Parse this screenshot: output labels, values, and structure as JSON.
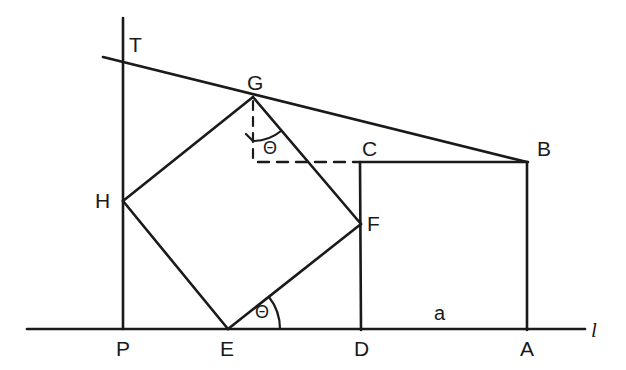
{
  "figure": {
    "type": "geometry-diagram",
    "background_color": "#ffffff",
    "stroke_color": "#1a1a1a",
    "canvas": {
      "width": 626,
      "height": 370
    }
  },
  "labels": {
    "T": "T",
    "G": "G",
    "H": "H",
    "C": "C",
    "B": "B",
    "F": "F",
    "P": "P",
    "E": "E",
    "D": "D",
    "A": "A",
    "line_l": "l",
    "side_a": "a",
    "theta_at_G": "Θ",
    "theta_at_E": "Θ"
  },
  "points": {
    "T": {
      "x": 123,
      "y": 57
    },
    "G": {
      "x": 253,
      "y": 97
    },
    "H": {
      "x": 123,
      "y": 201
    },
    "C": {
      "x": 360,
      "y": 162
    },
    "B": {
      "x": 527,
      "y": 162
    },
    "F": {
      "x": 361,
      "y": 224
    },
    "P": {
      "x": 123,
      "y": 329
    },
    "E": {
      "x": 228,
      "y": 329
    },
    "D": {
      "x": 361,
      "y": 329
    },
    "A": {
      "x": 527,
      "y": 329
    }
  },
  "label_positions": {
    "T": {
      "x": 129,
      "y": 34
    },
    "G": {
      "x": 247,
      "y": 72
    },
    "H": {
      "x": 95,
      "y": 190
    },
    "C": {
      "x": 362,
      "y": 138
    },
    "B": {
      "x": 537,
      "y": 138
    },
    "F": {
      "x": 367,
      "y": 213
    },
    "P": {
      "x": 116,
      "y": 338
    },
    "E": {
      "x": 220,
      "y": 338
    },
    "D": {
      "x": 354,
      "y": 338
    },
    "A": {
      "x": 520,
      "y": 338
    },
    "line_l": {
      "x": 591,
      "y": 320
    },
    "side_a": {
      "x": 434,
      "y": 303
    },
    "theta_at_G": {
      "x": 263,
      "y": 139
    },
    "theta_at_E": {
      "x": 255,
      "y": 303
    }
  },
  "segments": {
    "baseline_l": {
      "from": {
        "x": 27,
        "y": 329
      },
      "to": {
        "x": 585,
        "y": 329
      },
      "style": "solid"
    },
    "vertical_PT": {
      "from": {
        "x": 123,
        "y": 18
      },
      "to": {
        "x": 123,
        "y": 329
      },
      "style": "solid"
    },
    "tangent_TGB": {
      "from": {
        "x": 103,
        "y": 57
      },
      "to": {
        "x": 527,
        "y": 162
      },
      "style": "solid"
    },
    "square_GH": {
      "from": {
        "x": 253,
        "y": 97
      },
      "to": {
        "x": 123,
        "y": 201
      },
      "style": "solid"
    },
    "square_HE": {
      "from": {
        "x": 123,
        "y": 201
      },
      "to": {
        "x": 228,
        "y": 329
      },
      "style": "solid"
    },
    "square_EF": {
      "from": {
        "x": 228,
        "y": 329
      },
      "to": {
        "x": 361,
        "y": 224
      },
      "style": "solid"
    },
    "square_FG": {
      "from": {
        "x": 361,
        "y": 224
      },
      "to": {
        "x": 253,
        "y": 97
      },
      "style": "solid"
    },
    "rect_CB": {
      "from": {
        "x": 360,
        "y": 162
      },
      "to": {
        "x": 527,
        "y": 162
      },
      "style": "solid"
    },
    "rect_BA": {
      "from": {
        "x": 527,
        "y": 162
      },
      "to": {
        "x": 527,
        "y": 329
      },
      "style": "solid"
    },
    "rect_CD": {
      "from": {
        "x": 360,
        "y": 162
      },
      "to": {
        "x": 361,
        "y": 329
      },
      "style": "solid"
    },
    "dashed_G_vertical": {
      "from": {
        "x": 253,
        "y": 100
      },
      "to": {
        "x": 253,
        "y": 163
      },
      "style": "dashed"
    },
    "dashed_horizontal_to_C": {
      "from": {
        "x": 258,
        "y": 162
      },
      "to": {
        "x": 358,
        "y": 162
      },
      "style": "dashed"
    }
  },
  "angle_arcs": {
    "at_G": {
      "center": {
        "x": 253,
        "y": 97
      },
      "radius": 44,
      "from_deg": 90,
      "to_deg": 40,
      "note": "between downward vertical dashed line and segment GF"
    },
    "at_E": {
      "center": {
        "x": 228,
        "y": 329
      },
      "radius": 52,
      "from_deg": 0,
      "to_deg": 38,
      "note": "between baseline l and segment EF"
    }
  }
}
